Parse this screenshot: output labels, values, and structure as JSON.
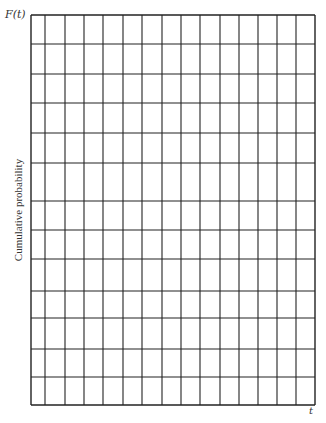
{
  "chart_data": {
    "type": "table",
    "title": "",
    "ylabel_symbol": "F(t)",
    "ylabel": "Cumulative probability",
    "xlabel": "t",
    "grid": true,
    "columns": 15,
    "rows": 13,
    "x_lines_px": [
      31,
      45,
      65,
      84,
      103,
      123,
      142,
      162,
      181,
      200,
      220,
      239,
      258,
      277,
      296,
      315
    ],
    "y_lines_px": [
      15,
      44,
      74,
      103,
      133,
      163,
      201,
      230,
      259,
      291,
      318,
      349,
      377,
      405
    ],
    "line_color": "#222222",
    "background": "#ffffff"
  },
  "labels": {
    "y_symbol": "F(t)",
    "y_axis": "Cumulative probability",
    "x_symbol": "t"
  }
}
